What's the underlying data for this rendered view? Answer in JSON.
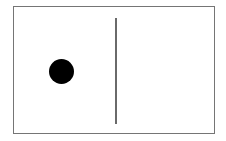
{
  "figure": {
    "title": "",
    "background_color": "#ffffff",
    "frame": {
      "label": "rectangle-border",
      "stroke_color": "#757575",
      "stroke_width": 1.5,
      "fill_color": "#ffffff",
      "x": 13,
      "y": 6,
      "width": 202,
      "height": 128
    },
    "shapes": [
      {
        "kind": "circle",
        "label": "filled-dot",
        "fill_color": "#000000",
        "stroke_color": "none",
        "center_x": 60,
        "center_y": 70,
        "diameter": 25,
        "radius": 12.5
      },
      {
        "kind": "line",
        "label": "vertical-divider",
        "stroke_color": "#6a6a6a",
        "stroke_width": 1.5,
        "x": 114,
        "y_start": 17,
        "y_end": 123,
        "length": 106,
        "orientation": "vertical"
      }
    ]
  },
  "chart_data": {
    "type": "scatter",
    "title": "",
    "xlabel": "",
    "ylabel": "",
    "grid": false,
    "legend": null,
    "xlim": [
      13,
      215
    ],
    "ylim": [
      6,
      134
    ],
    "points": [
      {
        "name": "dot",
        "x": 60,
        "y": 70,
        "size": 25,
        "color": "#000000"
      }
    ],
    "annotations": [
      {
        "name": "vertical-divider",
        "type": "vline",
        "x": 114,
        "y_range": [
          17,
          123
        ],
        "color": "#6a6a6a",
        "width": 1.5
      }
    ]
  }
}
